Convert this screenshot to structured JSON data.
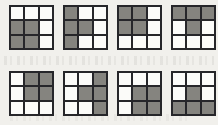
{
  "figure": {
    "name": "eight-3x3-shaded-grids",
    "background_color": "#f1f0ec",
    "border_color": "#26262a",
    "shaded_color": "#85847f",
    "empty_color": "#fbfbf9",
    "rows": 2,
    "columns": 4,
    "grid_size": 3
  },
  "grids": [
    {
      "id": "grid-1",
      "position": "row1-col1",
      "label": "1",
      "shaded_count": 4,
      "pattern_name": "bottom-left-block",
      "cells": [
        [
          "white",
          "white",
          "white"
        ],
        [
          "gray",
          "gray",
          "white"
        ],
        [
          "gray",
          "gray",
          "white"
        ]
      ]
    },
    {
      "id": "grid-2",
      "position": "row1-col2",
      "label": "2",
      "shaded_count": 4,
      "pattern_name": "left-column-plus-center",
      "cells": [
        [
          "gray",
          "white",
          "white"
        ],
        [
          "gray",
          "gray",
          "white"
        ],
        [
          "gray",
          "white",
          "white"
        ]
      ]
    },
    {
      "id": "grid-3",
      "position": "row1-col3",
      "label": "3",
      "shaded_count": 4,
      "pattern_name": "top-left-block",
      "cells": [
        [
          "gray",
          "gray",
          "white"
        ],
        [
          "gray",
          "gray",
          "white"
        ],
        [
          "white",
          "white",
          "white"
        ]
      ]
    },
    {
      "id": "grid-4",
      "position": "row1-col4",
      "label": "4",
      "shaded_count": 4,
      "pattern_name": "top-row-plus-center",
      "cells": [
        [
          "gray",
          "gray",
          "gray"
        ],
        [
          "white",
          "gray",
          "white"
        ],
        [
          "white",
          "white",
          "white"
        ]
      ]
    },
    {
      "id": "grid-5",
      "position": "row2-col1",
      "label": "5",
      "shaded_count": 4,
      "pattern_name": "top-right-block",
      "cells": [
        [
          "white",
          "gray",
          "gray"
        ],
        [
          "white",
          "gray",
          "gray"
        ],
        [
          "white",
          "white",
          "white"
        ]
      ]
    },
    {
      "id": "grid-6",
      "position": "row2-col2",
      "label": "6",
      "shaded_count": 4,
      "pattern_name": "right-column-plus-center",
      "cells": [
        [
          "white",
          "white",
          "gray"
        ],
        [
          "white",
          "gray",
          "gray"
        ],
        [
          "white",
          "white",
          "gray"
        ]
      ]
    },
    {
      "id": "grid-7",
      "position": "row2-col3",
      "label": "7",
      "shaded_count": 4,
      "pattern_name": "bottom-right-block",
      "cells": [
        [
          "white",
          "white",
          "white"
        ],
        [
          "white",
          "gray",
          "gray"
        ],
        [
          "white",
          "gray",
          "gray"
        ]
      ]
    },
    {
      "id": "grid-8",
      "position": "row2-col4",
      "label": "8",
      "shaded_count": 4,
      "pattern_name": "bottom-row-plus-center",
      "cells": [
        [
          "white",
          "white",
          "white"
        ],
        [
          "white",
          "gray",
          "white"
        ],
        [
          "gray",
          "gray",
          "gray"
        ]
      ]
    }
  ]
}
